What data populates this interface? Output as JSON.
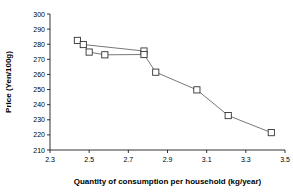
{
  "chart_data": {
    "type": "line",
    "title": "",
    "xlabel": "Quantity of consumption per household (kg/year)",
    "ylabel": "Price (Yen/100g)",
    "xlim": [
      2.3,
      3.5
    ],
    "ylim": [
      210,
      300
    ],
    "xticks": [
      "2.3",
      "2.5",
      "2.7",
      "2.9",
      "3.1",
      "3.3",
      "3.5"
    ],
    "xtick_values": [
      2.3,
      2.5,
      2.7,
      2.9,
      3.1,
      3.3,
      3.5
    ],
    "yticks": [
      "210",
      "220",
      "230",
      "240",
      "250",
      "260",
      "270",
      "280",
      "290",
      "300"
    ],
    "ytick_values": [
      210,
      220,
      230,
      240,
      250,
      260,
      270,
      280,
      290,
      300
    ],
    "grid": false,
    "legend": "none",
    "marker": "open-square",
    "line_color": "#555555",
    "marker_edge_color": "#333333",
    "marker_face_color": "#ffffff",
    "series": [
      {
        "name": "upper-branch",
        "x": [
          2.44,
          2.47,
          2.78
        ],
        "y": [
          282.5,
          279.8,
          275.5
        ]
      },
      {
        "name": "main-curve",
        "x": [
          2.44,
          2.47,
          2.5,
          2.58,
          2.78,
          2.84,
          3.05,
          3.21,
          3.43
        ],
        "y": [
          282.5,
          279.8,
          274.8,
          273.0,
          273.2,
          261.5,
          249.8,
          232.8,
          221.5
        ]
      }
    ]
  }
}
